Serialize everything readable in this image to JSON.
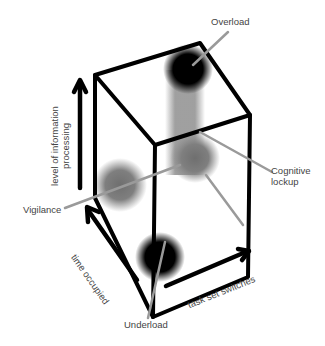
{
  "diagram": {
    "type": "3d-cube-conceptual-diagram",
    "axes": {
      "vertical": "level of information processing",
      "depth": "time occupied",
      "horizontal": "task set switches"
    },
    "states": [
      {
        "label": "Overload",
        "shade": "black"
      },
      {
        "label": "Cognitive",
        "label2": "lockup",
        "shade": "gray"
      },
      {
        "label": "Vigilance",
        "shade": "gray"
      },
      {
        "label": "Underload",
        "shade": "black"
      }
    ],
    "colors": {
      "line": "#000000",
      "leader": "#9a9a9a",
      "dark_blob": "#000000",
      "gray_blob": "#7a7a7a",
      "text": "#444444"
    }
  }
}
